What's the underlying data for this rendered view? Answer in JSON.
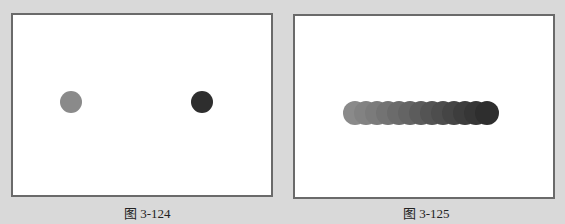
{
  "figures": [
    {
      "caption": "图 3-124",
      "circles": [
        {
          "cx": 58,
          "cy": 87,
          "r": 11,
          "color": "#8a8a8a"
        },
        {
          "cx": 189,
          "cy": 87,
          "r": 11,
          "color": "#2e2e2e"
        }
      ]
    },
    {
      "caption": "图 3-125",
      "blend_steps": 13,
      "start_color": "#8a8a8a",
      "end_color": "#2e2e2e"
    }
  ]
}
